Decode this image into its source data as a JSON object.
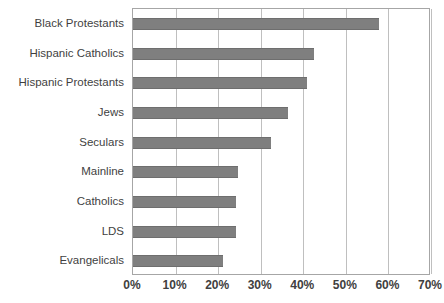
{
  "chart_data": {
    "type": "bar",
    "orientation": "horizontal",
    "title": "",
    "subtitle": "",
    "xlabel": "",
    "ylabel": "",
    "categories": [
      "Black Protestants",
      "Hispanic Catholics",
      "Hispanic Protestants",
      "Jews",
      "Seculars",
      "Mainline",
      "Catholics",
      "LDS",
      "Evangelicals"
    ],
    "values": [
      57.9,
      42.5,
      40.8,
      36.5,
      32.3,
      24.6,
      24.1,
      24.1,
      21.2
    ],
    "value_suffix": "%",
    "xlim": [
      0,
      70
    ],
    "xticks": [
      0,
      10,
      20,
      30,
      40,
      50,
      60,
      70
    ],
    "xtick_labels": [
      "0%",
      "10%",
      "20%",
      "30%",
      "40%",
      "50%",
      "60%",
      "70%"
    ],
    "grid": "vertical",
    "legend": "none",
    "series": [
      {
        "name": "",
        "color": "#7f7f7f",
        "values": [
          57.9,
          42.5,
          40.8,
          36.5,
          32.3,
          24.6,
          24.1,
          24.1,
          21.2
        ]
      }
    ],
    "colors": {
      "bar_fill": "#7f7f7f",
      "bar_edge": "#6e6e6e",
      "gridline": "#bfbfbf",
      "plot_border": "#a6a6a6",
      "text": "#3f3f3f",
      "background": "#ffffff"
    }
  }
}
